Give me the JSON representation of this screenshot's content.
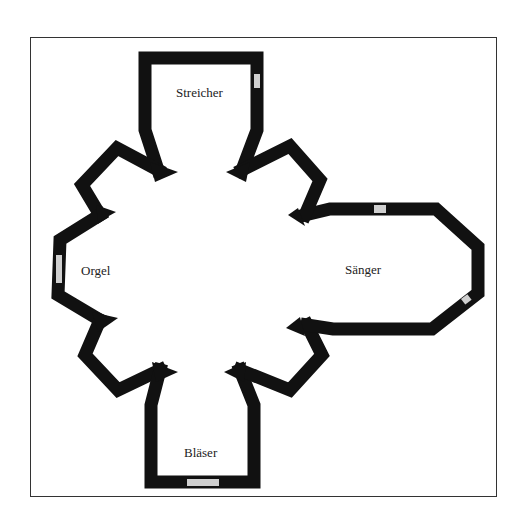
{
  "diagram": {
    "type": "floor-plan",
    "colors": {
      "wall": "#111111",
      "window": "#cfcfcf",
      "border": "#333333",
      "background": "#ffffff"
    },
    "rooms": [
      {
        "id": "streicher",
        "label": "Streicher"
      },
      {
        "id": "orgel",
        "label": "Orgel"
      },
      {
        "id": "saenger",
        "label": "Sänger"
      },
      {
        "id": "blaeser",
        "label": "Bläser"
      }
    ]
  }
}
